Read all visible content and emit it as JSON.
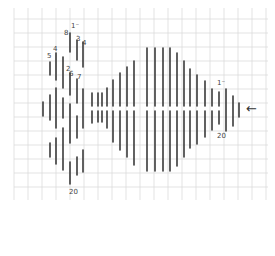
{
  "diagram": {
    "type": "hand-drawn bar/line sketch on graph paper",
    "colors": {
      "background": "#ffffff",
      "grid": "#dcdcdc",
      "bar": "#3a3a3a",
      "ink": "#444444"
    },
    "grid": {
      "x_start": 14,
      "x_end": 268,
      "y_start": 8,
      "y_end": 200,
      "cell": 14
    },
    "center_y": 109,
    "bars": [
      {
        "x": 43,
        "segments": [
          [
            102,
            116
          ]
        ]
      },
      {
        "x": 50,
        "segments": [
          [
            62,
            75
          ],
          [
            95,
            120
          ],
          [
            143,
            157
          ]
        ]
      },
      {
        "x": 56,
        "segments": [
          [
            53,
            80
          ],
          [
            88,
            128
          ],
          [
            138,
            164
          ]
        ]
      },
      {
        "x": 63,
        "segments": [
          [
            57,
            88
          ],
          [
            98,
            118
          ],
          [
            128,
            170
          ]
        ]
      },
      {
        "x": 70,
        "segments": [
          [
            33,
            52
          ],
          [
            73,
            95
          ],
          [
            104,
            143
          ],
          [
            162,
            184
          ]
        ]
      },
      {
        "x": 77,
        "segments": [
          [
            40,
            60
          ],
          [
            79,
            103
          ],
          [
            116,
            138
          ],
          [
            157,
            175
          ]
        ]
      },
      {
        "x": 83,
        "segments": [
          [
            42,
            67
          ],
          [
            89,
            128
          ],
          [
            150,
            172
          ]
        ]
      },
      {
        "x": 92,
        "segments": [
          [
            93,
            106
          ],
          [
            111,
            123
          ]
        ]
      },
      {
        "x": 98,
        "segments": [
          [
            93,
            106
          ],
          [
            111,
            122
          ]
        ]
      },
      {
        "x": 102,
        "segments": [
          [
            93,
            106
          ],
          [
            111,
            122
          ]
        ]
      },
      {
        "x": 107,
        "segments": [
          [
            88,
            106
          ],
          [
            111,
            128
          ]
        ]
      },
      {
        "x": 113,
        "segments": [
          [
            80,
            106
          ],
          [
            111,
            142
          ]
        ]
      },
      {
        "x": 120,
        "segments": [
          [
            73,
            106
          ],
          [
            111,
            150
          ]
        ]
      },
      {
        "x": 127,
        "segments": [
          [
            67,
            106
          ],
          [
            111,
            157
          ]
        ]
      },
      {
        "x": 134,
        "segments": [
          [
            61,
            106
          ],
          [
            111,
            165
          ]
        ]
      },
      {
        "x": 147,
        "segments": [
          [
            48,
            106
          ],
          [
            111,
            171
          ]
        ]
      },
      {
        "x": 155,
        "segments": [
          [
            48,
            106
          ],
          [
            111,
            171
          ]
        ]
      },
      {
        "x": 163,
        "segments": [
          [
            48,
            106
          ],
          [
            111,
            171
          ]
        ]
      },
      {
        "x": 170,
        "segments": [
          [
            48,
            106
          ],
          [
            111,
            171
          ]
        ]
      },
      {
        "x": 177,
        "segments": [
          [
            53,
            106
          ],
          [
            111,
            166
          ]
        ]
      },
      {
        "x": 184,
        "segments": [
          [
            61,
            106
          ],
          [
            111,
            157
          ]
        ]
      },
      {
        "x": 190,
        "segments": [
          [
            69,
            106
          ],
          [
            111,
            148
          ]
        ]
      },
      {
        "x": 197,
        "segments": [
          [
            75,
            106
          ],
          [
            111,
            144
          ]
        ]
      },
      {
        "x": 205,
        "segments": [
          [
            81,
            106
          ],
          [
            111,
            137
          ]
        ]
      },
      {
        "x": 212,
        "segments": [
          [
            89,
            106
          ],
          [
            111,
            130
          ]
        ]
      },
      {
        "x": 219,
        "segments": [
          [
            92,
            106
          ],
          [
            111,
            124
          ]
        ]
      },
      {
        "x": 226,
        "segments": [
          [
            89,
            131
          ]
        ]
      },
      {
        "x": 233,
        "segments": [
          [
            96,
            126
          ]
        ]
      },
      {
        "x": 239,
        "segments": [
          [
            103,
            117
          ]
        ]
      }
    ],
    "annotations": [
      {
        "id": "label-top",
        "text": "1⁻",
        "x": 71,
        "y": 23
      },
      {
        "id": "label-8",
        "text": "8",
        "x": 64,
        "y": 30
      },
      {
        "id": "label-3",
        "text": "3",
        "x": 76,
        "y": 36
      },
      {
        "id": "label-4-top",
        "text": "4",
        "x": 82,
        "y": 40
      },
      {
        "id": "label-4-left",
        "text": "4",
        "x": 53,
        "y": 46
      },
      {
        "id": "label-5",
        "text": "5",
        "x": 47,
        "y": 53
      },
      {
        "id": "label-2",
        "text": "2",
        "x": 66,
        "y": 66
      },
      {
        "id": "label-6",
        "text": "6",
        "x": 69,
        "y": 71
      },
      {
        "id": "label-7",
        "text": "7",
        "x": 77,
        "y": 74
      },
      {
        "id": "label-bottom-left",
        "text": "20",
        "x": 69,
        "y": 189
      },
      {
        "id": "label-right-top",
        "text": "1⁻",
        "x": 217,
        "y": 80
      },
      {
        "id": "label-right-bottom",
        "text": "20",
        "x": 217,
        "y": 133
      }
    ],
    "arrow": {
      "glyph": "←",
      "x": 246,
      "y": 102
    }
  }
}
